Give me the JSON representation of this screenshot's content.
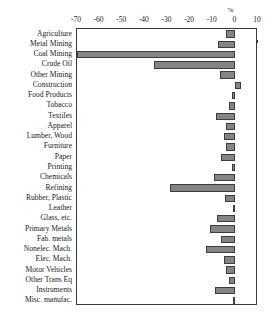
{
  "chart_data": {
    "type": "bar",
    "orientation": "horizontal",
    "title": "",
    "xlabel": "%",
    "ylabel": "",
    "xlim": [
      -70,
      10
    ],
    "xticks": [
      -70,
      -60,
      -50,
      -40,
      -30,
      -20,
      -10,
      0,
      10
    ],
    "xticklabels": [
      "-70",
      "-60",
      "-50",
      "-40",
      "-30",
      "-20",
      "-10",
      "0",
      "10"
    ],
    "grid": false,
    "legend": false,
    "bar_color": "#848484",
    "bar_edge_color": "#3d3d3d",
    "frame_color": "#3a3a3a",
    "categories": [
      "Agriculture",
      "Metal Mining",
      "Coal Mining",
      "Crude Oil",
      "Other Mining",
      "Construction",
      "Food Products",
      "Tobacco",
      "Textiles",
      "Apparel",
      "Lumber, Wood",
      "Furniture",
      "Paper",
      "Printing",
      "Chemicals",
      "Refining",
      "Rubber, Plastic",
      "Leather",
      "Glass, etc.",
      "Primary Metals",
      "Fab. metals",
      "Nonelec. Mach.",
      "Elec. Mach.",
      "Motor Vehicles",
      "Other Trans Eq",
      "Instruments",
      "Misc. manufac."
    ],
    "values": [
      -4.0,
      -7.5,
      -70.0,
      -36.0,
      -7.0,
      2.5,
      -1.5,
      -3.0,
      -8.5,
      -4.0,
      -5.0,
      -4.0,
      -6.5,
      -1.5,
      -9.5,
      -29.0,
      -4.5,
      -1.0,
      -8.0,
      -11.0,
      -6.5,
      -13.0,
      -5.0,
      -4.0,
      -3.0,
      -9.0,
      -1.0
    ]
  }
}
